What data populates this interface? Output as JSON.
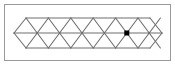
{
  "figure": {
    "kind": "geometric-diagram",
    "panel": {
      "x": 4.5,
      "y": 4.5,
      "width": 166,
      "height": 56,
      "fill": "#ffffff",
      "stroke": "#9a9a9a",
      "stroke_width": 1
    },
    "colors": {
      "background": "#ffffff",
      "frame_stroke": "#9a9a9a",
      "lattice_stroke": "#6e6e6e",
      "marker_fill": "#000000"
    },
    "lattice": {
      "stroke_width": 1.1,
      "left_tip_x": 14,
      "right_tip_x": 162,
      "top_y": 18,
      "mid_y": 33,
      "bottom_y": 48,
      "column_start_x": 26,
      "column_step": 22.4,
      "column_count": 7,
      "up_triangles": 7,
      "down_triangles": 7,
      "interior_vertices_mid": 6
    },
    "horizontal_lines": [
      {
        "name": "top-edge",
        "x1": 26,
        "y1": 18,
        "x2": 150,
        "y2": 18
      },
      {
        "name": "middle-axis",
        "x1": 14,
        "y1": 33,
        "x2": 162,
        "y2": 33
      },
      {
        "name": "bottom-edge",
        "x1": 26,
        "y1": 48,
        "x2": 150,
        "y2": 48
      }
    ],
    "boundary_segments": [
      {
        "name": "left-upper-edge",
        "x1": 14,
        "y1": 33,
        "x2": 26,
        "y2": 18
      },
      {
        "name": "left-lower-edge",
        "x1": 14,
        "y1": 33,
        "x2": 26,
        "y2": 48
      },
      {
        "name": "right-upper-edge",
        "x1": 150,
        "y1": 18,
        "x2": 162,
        "y2": 33
      },
      {
        "name": "right-lower-edge",
        "x1": 150,
        "y1": 48,
        "x2": 162,
        "y2": 33
      }
    ],
    "diagonals_up": [
      {
        "x1": 26,
        "y1": 18,
        "x2": 37.2,
        "y2": 33
      },
      {
        "x1": 48.4,
        "y1": 18,
        "x2": 59.6,
        "y2": 33
      },
      {
        "x1": 70.8,
        "y1": 18,
        "x2": 82.0,
        "y2": 33
      },
      {
        "x1": 93.2,
        "y1": 18,
        "x2": 104.4,
        "y2": 33
      },
      {
        "x1": 115.6,
        "y1": 18,
        "x2": 126.8,
        "y2": 33
      },
      {
        "x1": 138.0,
        "y1": 18,
        "x2": 149.2,
        "y2": 33
      },
      {
        "x1": 37.2,
        "y1": 33,
        "x2": 48.4,
        "y2": 18
      },
      {
        "x1": 59.6,
        "y1": 33,
        "x2": 70.8,
        "y2": 18
      },
      {
        "x1": 82.0,
        "y1": 33,
        "x2": 93.2,
        "y2": 18
      },
      {
        "x1": 104.4,
        "y1": 33,
        "x2": 115.6,
        "y2": 18
      },
      {
        "x1": 126.8,
        "y1": 33,
        "x2": 138.0,
        "y2": 18
      },
      {
        "x1": 149.2,
        "y1": 33,
        "x2": 150,
        "y2": 32
      }
    ],
    "diagonals_down": [
      {
        "x1": 26,
        "y1": 48,
        "x2": 37.2,
        "y2": 33
      },
      {
        "x1": 48.4,
        "y1": 48,
        "x2": 59.6,
        "y2": 33
      },
      {
        "x1": 70.8,
        "y1": 48,
        "x2": 82.0,
        "y2": 33
      },
      {
        "x1": 93.2,
        "y1": 48,
        "x2": 104.4,
        "y2": 33
      },
      {
        "x1": 115.6,
        "y1": 48,
        "x2": 126.8,
        "y2": 33
      },
      {
        "x1": 138.0,
        "y1": 48,
        "x2": 149.2,
        "y2": 33
      },
      {
        "x1": 37.2,
        "y1": 33,
        "x2": 48.4,
        "y2": 48
      },
      {
        "x1": 59.6,
        "y1": 33,
        "x2": 70.8,
        "y2": 48
      },
      {
        "x1": 82.0,
        "y1": 33,
        "x2": 93.2,
        "y2": 48
      },
      {
        "x1": 104.4,
        "y1": 33,
        "x2": 115.6,
        "y2": 48
      },
      {
        "x1": 126.8,
        "y1": 33,
        "x2": 138.0,
        "y2": 48
      },
      {
        "x1": 149.2,
        "y1": 33,
        "x2": 150,
        "y2": 34
      }
    ],
    "marker": {
      "name": "marked-vertex",
      "shape": "square",
      "cx": 126.8,
      "cy": 33,
      "size": 5,
      "fill": "#000000"
    }
  }
}
